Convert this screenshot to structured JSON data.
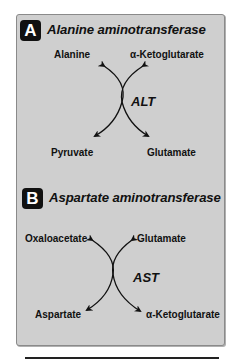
{
  "panels": [
    {
      "badge": "A",
      "title": "Alanine aminotransferase",
      "enzyme_abbrev": "ALT",
      "top_left": "Alanine",
      "top_right": "α-Ketoglutarate",
      "bottom_left": "Pyruvate",
      "bottom_right": "Glutamate"
    },
    {
      "badge": "B",
      "title": "Aspartate aminotransferase",
      "enzyme_abbrev": "AST",
      "top_left": "Oxaloacetate",
      "top_right": "Glutamate",
      "bottom_left": "Aspartate",
      "bottom_right": "α-Ketoglutarate"
    }
  ],
  "colors": {
    "panel_background": "#cfcfcf",
    "badge_background": "#111111",
    "text": "#111111"
  }
}
